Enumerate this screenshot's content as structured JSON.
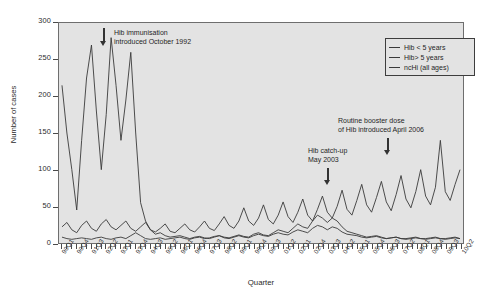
{
  "chart_data": {
    "type": "line",
    "title": "",
    "xlabel": "Quarter",
    "ylabel": "Number of cases",
    "ylim": [
      0,
      300
    ],
    "ytick_step": 50,
    "yticks": [
      0,
      50,
      100,
      150,
      200,
      250,
      300
    ],
    "grid": false,
    "legend_position": "top-right",
    "background_color": "#e3e3e3",
    "line_color": "#3a3a3a",
    "x_label_every": 3,
    "categories": [
      "90Q1",
      "90Q2",
      "90Q3",
      "90Q4",
      "91Q1",
      "91Q2",
      "91Q3",
      "91Q4",
      "92Q1",
      "92Q2",
      "92Q3",
      "92Q4",
      "93Q1",
      "93Q2",
      "93Q3",
      "93Q4",
      "94Q1",
      "94Q2",
      "94Q3",
      "94Q4",
      "95Q1",
      "95Q2",
      "95Q3",
      "95Q4",
      "96Q1",
      "96Q2",
      "96Q3",
      "96Q4",
      "97Q1",
      "97Q2",
      "97Q3",
      "97Q4",
      "98Q1",
      "98Q2",
      "98Q3",
      "98Q4",
      "99Q1",
      "99Q2",
      "99Q3",
      "99Q4",
      "00Q1",
      "00Q2",
      "00Q3",
      "00Q4",
      "01Q1",
      "01Q2",
      "01Q3",
      "01Q4",
      "02Q1",
      "02Q2",
      "02Q3",
      "02Q4",
      "03Q1",
      "03Q2",
      "03Q3",
      "03Q4",
      "04Q1",
      "04Q2",
      "04Q3",
      "04Q4",
      "05Q1",
      "05Q2",
      "05Q3",
      "05Q4",
      "06Q1",
      "06Q2",
      "06Q3",
      "06Q4",
      "07Q1",
      "07Q2",
      "07Q3",
      "07Q4",
      "08Q1",
      "08Q2",
      "08Q3",
      "08Q4",
      "09Q1",
      "09Q2",
      "09Q3",
      "09Q4",
      "10Q1",
      "10Q2"
    ],
    "series": [
      {
        "name": "Hib < 5 years",
        "color": "#3a3a3a",
        "values": [
          215,
          150,
          100,
          45,
          140,
          225,
          270,
          180,
          100,
          175,
          280,
          215,
          140,
          195,
          260,
          150,
          55,
          30,
          18,
          12,
          14,
          10,
          8,
          9,
          10,
          8,
          6,
          8,
          9,
          7,
          6,
          8,
          10,
          8,
          7,
          9,
          11,
          9,
          8,
          12,
          14,
          11,
          10,
          14,
          18,
          16,
          14,
          20,
          26,
          22,
          20,
          30,
          38,
          34,
          28,
          34,
          30,
          22,
          16,
          14,
          12,
          10,
          8,
          9,
          10,
          8,
          6,
          7,
          8,
          6,
          5,
          6,
          7,
          6,
          5,
          6,
          7,
          6,
          5,
          6,
          7,
          6
        ]
      },
      {
        "name": "Hib> 5 years",
        "color": "#3a3a3a",
        "values": [
          8,
          6,
          5,
          6,
          7,
          6,
          5,
          7,
          8,
          6,
          5,
          7,
          8,
          6,
          10,
          14,
          10,
          6,
          5,
          6,
          7,
          5,
          6,
          7,
          8,
          6,
          5,
          7,
          8,
          6,
          7,
          9,
          10,
          7,
          6,
          8,
          10,
          8,
          7,
          10,
          12,
          10,
          9,
          12,
          14,
          12,
          11,
          15,
          18,
          16,
          14,
          20,
          24,
          22,
          18,
          22,
          20,
          15,
          12,
          11,
          10,
          8,
          7,
          8,
          9,
          7,
          6,
          7,
          8,
          6,
          6,
          7,
          8,
          6,
          6,
          7,
          8,
          6,
          6,
          7,
          8,
          6
        ]
      },
      {
        "name": "ncHi (all ages)",
        "color": "#3a3a3a",
        "values": [
          22,
          28,
          18,
          14,
          24,
          30,
          20,
          16,
          26,
          32,
          22,
          18,
          24,
          30,
          20,
          16,
          22,
          28,
          18,
          15,
          20,
          26,
          16,
          14,
          20,
          26,
          18,
          15,
          22,
          30,
          20,
          17,
          26,
          36,
          24,
          20,
          30,
          48,
          30,
          24,
          34,
          52,
          32,
          26,
          38,
          56,
          36,
          28,
          42,
          60,
          38,
          30,
          46,
          64,
          42,
          34,
          50,
          72,
          46,
          38,
          58,
          80,
          52,
          42,
          62,
          84,
          56,
          44,
          66,
          92,
          60,
          48,
          70,
          100,
          64,
          52,
          76,
          140,
          70,
          58,
          80,
          100
        ]
      }
    ],
    "annotations": [
      {
        "id": "hib-immunisation",
        "lines": [
          "Hib immunisation",
          "introduced October 1992"
        ],
        "text": "Hib immunisation introduced October 1992",
        "label_left": 114,
        "label_top": 28,
        "arrow_left": 99,
        "arrow_top": 28,
        "arrow_height": 18
      },
      {
        "id": "hib-catch-up",
        "lines": [
          "Hib catch-up",
          "May 2003"
        ],
        "text": "Hib catch-up May 2003",
        "label_left": 308,
        "label_top": 146,
        "arrow_left": 323,
        "arrow_top": 168,
        "arrow_height": 17
      },
      {
        "id": "routine-booster",
        "lines": [
          "Routine booster dose",
          "of Hib introduced April 2006"
        ],
        "text": "Routine booster dose of Hib introduced April 2006",
        "label_left": 338,
        "label_top": 116,
        "arrow_left": 383,
        "arrow_top": 138,
        "arrow_height": 17
      }
    ]
  },
  "legend": {
    "items": [
      {
        "label": "Hib < 5 years"
      },
      {
        "label": "Hib> 5 years"
      },
      {
        "label": "ncHi (all ages)"
      }
    ]
  },
  "axes": {
    "y_title": "Number of cases",
    "x_title": "Quarter"
  }
}
